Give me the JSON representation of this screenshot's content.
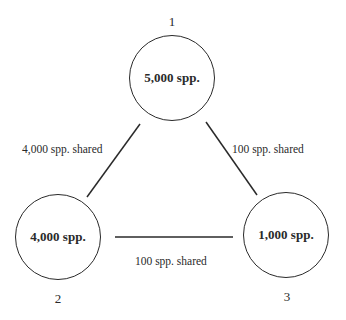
{
  "nodes": [
    {
      "id": "1",
      "number": "1",
      "label": "5,000 spp."
    },
    {
      "id": "2",
      "number": "2",
      "label": "4,000 spp."
    },
    {
      "id": "3",
      "number": "3",
      "label": "1,000 spp."
    }
  ],
  "edges": [
    {
      "from": "1",
      "to": "2",
      "label": "4,000 spp. shared"
    },
    {
      "from": "1",
      "to": "3",
      "label": "100 spp. shared"
    },
    {
      "from": "2",
      "to": "3",
      "label": "100 spp. shared"
    }
  ],
  "colors": {
    "stroke": "#2a2a2a",
    "background": "#ffffff"
  }
}
